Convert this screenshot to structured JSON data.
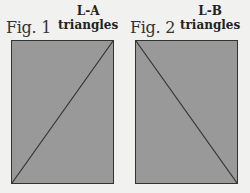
{
  "figures": [
    {
      "label": "Fig. 1",
      "title_line1": "L-A",
      "title_line2": "triangles",
      "diagonal": "bottom-left to top-right"
    },
    {
      "label": "Fig. 2",
      "title_line1": "L-B",
      "title_line2": "triangles",
      "diagonal": "top-left to bottom-right"
    }
  ],
  "colors": {
    "background": "#f1f1f0",
    "fill": "#999999",
    "stroke": "#333333"
  }
}
